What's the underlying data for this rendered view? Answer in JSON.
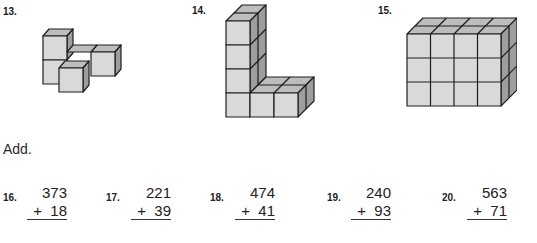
{
  "figures": [
    {
      "number": "13.",
      "description": "L-shaped arrangement of cubes: 2-high column at back-left, cubes extending right and front",
      "cube_count": 4
    },
    {
      "number": "14.",
      "description": "L-shaped figure: 4-cube tall column with 3 cubes along the bottom, 2 deep",
      "cube_count": 12
    },
    {
      "number": "15.",
      "description": "Rectangular prism of cubes 4 wide × 3 high × 2 deep",
      "cube_count": 24
    }
  ],
  "section_label": "Add.",
  "problems": [
    {
      "number": "16.",
      "top": "373",
      "bottom": "+  18"
    },
    {
      "number": "17.",
      "top": "221",
      "bottom": "+  39"
    },
    {
      "number": "18.",
      "top": "474",
      "bottom": "+  41"
    },
    {
      "number": "19.",
      "top": "240",
      "bottom": "+  93"
    },
    {
      "number": "20.",
      "top": "563",
      "bottom": "+  71"
    }
  ],
  "colors": {
    "cube_front": "#d9d9d9",
    "cube_top": "#bdbdbd",
    "cube_side": "#9e9e9e",
    "outline": "#1e1e1e"
  }
}
